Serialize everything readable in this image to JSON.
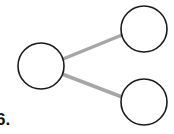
{
  "diagram": {
    "label": "6.",
    "nodes": [
      {
        "id": "left",
        "cx": 41,
        "cy": 66,
        "r": 23
      },
      {
        "id": "top-right",
        "cx": 144,
        "cy": 29,
        "r": 23
      },
      {
        "id": "bottom-right",
        "cx": 144,
        "cy": 102,
        "r": 23
      }
    ],
    "edges": [
      {
        "from": "left",
        "to": "top-right"
      },
      {
        "from": "left",
        "to": "bottom-right"
      }
    ],
    "colors": {
      "node_stroke": "#1a1a1a",
      "edge": "#a6a6a6",
      "node_fill": "#ffffff"
    }
  }
}
